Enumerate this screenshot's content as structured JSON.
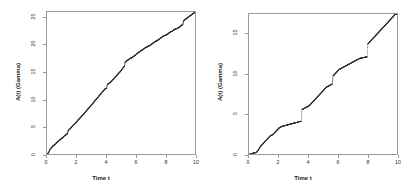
{
  "figure": {
    "background_color": "#ffffff",
    "axis_color": "#9a9a9a",
    "point_color": "#333333"
  },
  "chart_data": [
    {
      "type": "scatter",
      "panel": "left",
      "title": "",
      "xlabel": "Time t",
      "ylabel": "A(t) (Gamma)",
      "xlim": [
        0,
        10
      ],
      "ylim": [
        0,
        26
      ],
      "xticks": [
        0,
        2,
        4,
        6,
        8,
        10
      ],
      "xticklabels": [
        "0",
        "2",
        "4",
        "6",
        "8",
        "10"
      ],
      "yticks": [
        0,
        5,
        10,
        15,
        20,
        25
      ],
      "yticklabels": [
        "0",
        "5",
        "10",
        "15",
        "20",
        "25"
      ],
      "grid": false,
      "legend": "none",
      "series": [
        {
          "name": "A(t) gamma subordinator path",
          "x": [
            0.0,
            0.05,
            0.1,
            0.15,
            0.2,
            0.25,
            0.3,
            0.35,
            0.4,
            0.45,
            0.5,
            0.55,
            0.6,
            0.65,
            0.7,
            0.75,
            0.8,
            0.85,
            0.9,
            0.95,
            1.0,
            1.05,
            1.1,
            1.15,
            1.2,
            1.25,
            1.3,
            1.35,
            1.4,
            1.45,
            1.5,
            1.55,
            1.6,
            1.65,
            1.7,
            1.75,
            1.8,
            1.85,
            1.9,
            1.95,
            2.0,
            2.05,
            2.1,
            2.15,
            2.2,
            2.25,
            2.3,
            2.35,
            2.4,
            2.45,
            2.5,
            2.55,
            2.6,
            2.65,
            2.7,
            2.75,
            2.8,
            2.85,
            2.9,
            2.95,
            3.0,
            3.05,
            3.1,
            3.15,
            3.2,
            3.25,
            3.3,
            3.35,
            3.4,
            3.45,
            3.5,
            3.55,
            3.6,
            3.65,
            3.7,
            3.75,
            3.8,
            3.85,
            3.9,
            3.95,
            4.0,
            4.05,
            4.1,
            4.15,
            4.2,
            4.25,
            4.3,
            4.35,
            4.4,
            4.45,
            4.5,
            4.55,
            4.6,
            4.65,
            4.7,
            4.75,
            4.8,
            4.85,
            4.9,
            4.95,
            5.0,
            5.05,
            5.1,
            5.15,
            5.2,
            5.25,
            5.3,
            5.35,
            5.4,
            5.45,
            5.5,
            5.55,
            5.6,
            5.65,
            5.7,
            5.75,
            5.8,
            5.85,
            5.9,
            5.95,
            6.0,
            6.05,
            6.1,
            6.15,
            6.2,
            6.25,
            6.3,
            6.35,
            6.4,
            6.45,
            6.5,
            6.55,
            6.6,
            6.65,
            6.7,
            6.75,
            6.8,
            6.85,
            6.9,
            6.95,
            7.0,
            7.05,
            7.1,
            7.15,
            7.2,
            7.25,
            7.3,
            7.35,
            7.4,
            7.45,
            7.5,
            7.55,
            7.6,
            7.65,
            7.7,
            7.75,
            7.8,
            7.85,
            7.9,
            7.95,
            8.0,
            8.05,
            8.1,
            8.15,
            8.2,
            8.25,
            8.3,
            8.35,
            8.4,
            8.45,
            8.5,
            8.55,
            8.6,
            8.65,
            8.7,
            8.75,
            8.8,
            8.85,
            8.9,
            8.95,
            9.0,
            9.05,
            9.1,
            9.15,
            9.2,
            9.25,
            9.3,
            9.35,
            9.4,
            9.45,
            9.5,
            9.55,
            9.6,
            9.65,
            9.7,
            9.75,
            9.8,
            9.85,
            9.9,
            9.95,
            10.0
          ],
          "y": [
            0.0,
            0.25,
            0.45,
            0.75,
            1.0,
            1.15,
            1.3,
            1.45,
            1.6,
            1.7,
            1.8,
            1.95,
            2.1,
            2.2,
            2.3,
            2.45,
            2.6,
            2.7,
            2.8,
            2.9,
            3.0,
            3.1,
            3.25,
            3.4,
            3.5,
            3.6,
            3.7,
            3.8,
            4.3,
            4.5,
            4.6,
            4.75,
            4.9,
            5.05,
            5.2,
            5.35,
            5.5,
            5.6,
            5.75,
            5.9,
            6.0,
            6.2,
            6.4,
            6.5,
            6.65,
            6.8,
            6.95,
            7.1,
            7.25,
            7.4,
            7.5,
            7.7,
            7.85,
            8.0,
            8.2,
            8.35,
            8.5,
            8.65,
            8.8,
            8.95,
            9.1,
            9.3,
            9.45,
            9.6,
            9.8,
            9.95,
            10.1,
            10.25,
            10.4,
            10.6,
            10.75,
            10.9,
            11.05,
            11.2,
            11.4,
            11.55,
            11.7,
            11.85,
            12.0,
            12.05,
            12.1,
            12.8,
            12.9,
            13.0,
            13.1,
            13.2,
            13.3,
            13.45,
            13.6,
            13.75,
            13.9,
            14.05,
            14.2,
            14.35,
            14.5,
            14.65,
            14.8,
            14.95,
            15.1,
            15.25,
            15.4,
            15.6,
            15.8,
            16.0,
            16.1,
            16.9,
            17.0,
            17.1,
            17.2,
            17.3,
            17.4,
            17.5,
            17.6,
            17.65,
            17.7,
            17.8,
            17.9,
            18.0,
            18.1,
            18.2,
            18.3,
            18.45,
            18.55,
            18.65,
            18.75,
            18.85,
            18.95,
            19.0,
            19.1,
            19.2,
            19.3,
            19.4,
            19.5,
            19.6,
            19.65,
            19.7,
            19.8,
            19.85,
            19.9,
            20.0,
            20.1,
            20.2,
            20.3,
            20.4,
            20.5,
            20.6,
            20.7,
            20.75,
            20.8,
            20.9,
            21.0,
            21.1,
            21.2,
            21.3,
            21.4,
            21.5,
            21.6,
            21.7,
            21.75,
            21.8,
            21.85,
            21.9,
            22.0,
            22.1,
            22.2,
            22.3,
            22.4,
            22.5,
            22.5,
            22.6,
            22.7,
            22.8,
            22.9,
            22.95,
            23.0,
            23.05,
            23.1,
            23.2,
            23.3,
            23.4,
            23.5,
            23.6,
            23.7,
            23.8,
            24.4,
            24.6,
            24.7,
            24.8,
            24.9,
            25.0,
            25.1,
            25.2,
            25.3,
            25.4,
            25.5,
            25.6,
            25.7,
            25.8,
            25.9,
            26.0
          ]
        }
      ]
    },
    {
      "type": "scatter",
      "panel": "right",
      "title": "",
      "xlabel": "Time t",
      "ylabel": "A(t) (Gamma)",
      "xlim": [
        0,
        10
      ],
      "ylim": [
        0,
        17.5
      ],
      "xticks": [
        0,
        2,
        4,
        6,
        8,
        10
      ],
      "xticklabels": [
        "0",
        "2",
        "4",
        "6",
        "8",
        "10"
      ],
      "yticks": [
        0,
        5,
        10,
        15
      ],
      "yticklabels": [
        "0",
        "5",
        "10",
        "15"
      ],
      "grid": false,
      "legend": "none",
      "series": [
        {
          "name": "A(t) gamma subordinator path",
          "x": [
            0.0,
            0.05,
            0.1,
            0.15,
            0.2,
            0.25,
            0.3,
            0.35,
            0.4,
            0.45,
            0.5,
            0.55,
            0.6,
            0.65,
            0.7,
            0.75,
            0.8,
            0.85,
            0.9,
            0.95,
            1.0,
            1.05,
            1.1,
            1.15,
            1.2,
            1.25,
            1.3,
            1.35,
            1.4,
            1.45,
            1.5,
            1.55,
            1.6,
            1.65,
            1.7,
            1.75,
            1.8,
            1.85,
            1.9,
            1.95,
            2.0,
            2.05,
            2.1,
            2.15,
            2.2,
            2.25,
            2.3,
            2.35,
            2.4,
            2.45,
            2.5,
            2.55,
            2.6,
            2.65,
            2.7,
            2.75,
            2.8,
            2.85,
            2.9,
            2.95,
            3.0,
            3.05,
            3.1,
            3.15,
            3.2,
            3.25,
            3.3,
            3.35,
            3.4,
            3.45,
            3.5,
            3.55,
            3.6,
            3.65,
            3.7,
            3.75,
            3.8,
            3.85,
            3.9,
            3.95,
            4.0,
            4.05,
            4.1,
            4.15,
            4.2,
            4.25,
            4.3,
            4.35,
            4.4,
            4.45,
            4.5,
            4.55,
            4.6,
            4.65,
            4.7,
            4.75,
            4.8,
            4.85,
            4.9,
            4.95,
            5.0,
            5.05,
            5.1,
            5.15,
            5.2,
            5.25,
            5.3,
            5.35,
            5.4,
            5.45,
            5.5,
            5.55,
            5.6,
            5.65,
            5.7,
            5.75,
            5.8,
            5.85,
            5.9,
            5.95,
            6.0,
            6.05,
            6.1,
            6.15,
            6.2,
            6.25,
            6.3,
            6.35,
            6.4,
            6.45,
            6.5,
            6.55,
            6.6,
            6.65,
            6.7,
            6.75,
            6.8,
            6.85,
            6.9,
            6.95,
            7.0,
            7.05,
            7.1,
            7.15,
            7.2,
            7.25,
            7.3,
            7.35,
            7.4,
            7.45,
            7.5,
            7.55,
            7.6,
            7.65,
            7.7,
            7.75,
            7.8,
            7.85,
            7.9,
            7.95,
            8.0,
            8.05,
            8.1,
            8.15,
            8.2,
            8.25,
            8.3,
            8.35,
            8.4,
            8.45,
            8.5,
            8.55,
            8.6,
            8.65,
            8.7,
            8.75,
            8.8,
            8.85,
            8.9,
            8.95,
            9.0,
            9.05,
            9.1,
            9.15,
            9.2,
            9.25,
            9.3,
            9.35,
            9.4,
            9.45,
            9.5,
            9.55,
            9.6,
            9.65,
            9.7,
            9.75,
            9.8,
            9.85,
            9.9,
            9.95,
            10.0
          ],
          "y": [
            0.0,
            0.05,
            0.08,
            0.1,
            0.12,
            0.15,
            0.18,
            0.2,
            0.22,
            0.25,
            0.3,
            0.4,
            0.55,
            0.7,
            0.85,
            1.0,
            1.1,
            1.2,
            1.3,
            1.4,
            1.5,
            1.6,
            1.7,
            1.8,
            1.9,
            2.0,
            2.1,
            2.2,
            2.3,
            2.35,
            2.4,
            2.45,
            2.5,
            2.6,
            2.7,
            2.8,
            2.9,
            3.0,
            3.1,
            3.2,
            3.3,
            3.35,
            3.4,
            3.45,
            3.5,
            3.52,
            3.55,
            3.58,
            3.6,
            3.62,
            3.65,
            3.68,
            3.7,
            3.72,
            3.75,
            3.78,
            3.8,
            3.82,
            3.85,
            3.88,
            3.9,
            3.92,
            3.95,
            3.98,
            4.0,
            4.02,
            4.05,
            4.08,
            4.1,
            4.12,
            4.15,
            5.6,
            5.65,
            5.7,
            5.75,
            5.8,
            5.85,
            5.9,
            5.95,
            6.0,
            6.05,
            6.1,
            6.2,
            6.3,
            6.4,
            6.5,
            6.6,
            6.7,
            6.8,
            6.9,
            7.0,
            7.1,
            7.2,
            7.3,
            7.4,
            7.5,
            7.6,
            7.7,
            7.8,
            7.9,
            8.0,
            8.1,
            8.2,
            8.3,
            8.4,
            8.45,
            8.5,
            8.55,
            8.6,
            8.65,
            8.7,
            8.75,
            8.8,
            9.8,
            9.9,
            10.0,
            10.1,
            10.2,
            10.3,
            10.4,
            10.5,
            10.6,
            10.65,
            10.7,
            10.75,
            10.8,
            10.85,
            10.9,
            10.95,
            11.0,
            11.05,
            11.1,
            11.15,
            11.2,
            11.25,
            11.3,
            11.35,
            11.4,
            11.45,
            11.5,
            11.55,
            11.6,
            11.65,
            11.7,
            11.75,
            11.8,
            11.85,
            11.9,
            11.95,
            12.0,
            12.02,
            12.04,
            12.06,
            12.08,
            12.1,
            12.12,
            12.14,
            12.16,
            12.18,
            12.2,
            13.8,
            13.9,
            14.0,
            14.1,
            14.2,
            14.3,
            14.4,
            14.5,
            14.6,
            14.7,
            14.8,
            14.9,
            15.0,
            15.1,
            15.2,
            15.3,
            15.4,
            15.5,
            15.6,
            15.7,
            15.8,
            15.9,
            16.0,
            16.1,
            16.2,
            16.3,
            16.4,
            16.5,
            16.6,
            16.7,
            16.8,
            16.9,
            17.0,
            17.1,
            17.2,
            17.3,
            17.4
          ]
        }
      ]
    }
  ]
}
